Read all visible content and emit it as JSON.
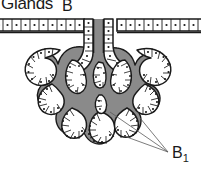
{
  "figure": {
    "title": "Glands",
    "type": "histology-diagram",
    "width": 201,
    "height": 174,
    "background_color": "#ffffff"
  },
  "labels": {
    "b": {
      "text": "B",
      "refers_to": "gland duct opening at surface epithelium"
    },
    "b1": {
      "text": "B",
      "subscript": "1",
      "refers_to": "terminal secretory acini"
    }
  },
  "colors": {
    "outline": "#1a1a1a",
    "stroma_gray": "#8a8a8a",
    "lumen_white": "#ffffff",
    "nucleus": "#1a1a1a",
    "leader_line": "#5a5a5a",
    "text": "#1a1a1a"
  },
  "structures": {
    "surface_epithelium": "horizontal cell band spanning full width",
    "duct": "vertical duct descending from surface into gland body",
    "gland_body": "branching gray mass with white tubular lumens",
    "acini": "finger-like terminal lobules along lower margin",
    "leader_lines": 3
  }
}
